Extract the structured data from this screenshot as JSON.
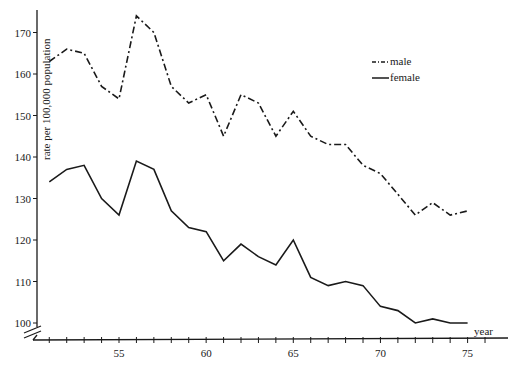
{
  "chart_data": {
    "type": "line",
    "title": "",
    "xlabel": "year",
    "ylabel": "rate per 100,000 population",
    "x": [
      51,
      52,
      53,
      54,
      55,
      56,
      57,
      58,
      59,
      60,
      61,
      62,
      63,
      64,
      65,
      66,
      67,
      68,
      69,
      70,
      71,
      72,
      73,
      74,
      75
    ],
    "x_ticks": [
      55,
      60,
      65,
      70,
      75
    ],
    "y_ticks": [
      100,
      110,
      120,
      130,
      140,
      150,
      160,
      170
    ],
    "xlim": [
      50,
      77
    ],
    "ylim": [
      97,
      175
    ],
    "y_axis_break": true,
    "grid": false,
    "legend_position": "upper right",
    "series": [
      {
        "name": "male",
        "style": "dash-dot",
        "values": [
          163,
          166,
          165,
          157,
          154,
          174,
          170,
          157,
          153,
          155,
          145,
          155,
          153,
          145,
          151,
          145,
          143,
          143,
          138,
          136,
          131,
          126,
          129,
          126,
          127
        ]
      },
      {
        "name": "female",
        "style": "solid",
        "values": [
          134,
          137,
          138,
          130,
          126,
          139,
          137,
          127,
          123,
          122,
          115,
          119,
          116,
          114,
          120,
          111,
          109,
          110,
          109,
          104,
          103,
          100,
          101,
          100,
          100
        ]
      }
    ]
  }
}
